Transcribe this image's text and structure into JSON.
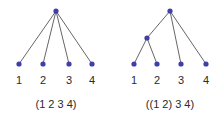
{
  "colors": {
    "node": "#3f3fa8",
    "edge": "#555555",
    "text": "#2a2a2a"
  },
  "trees": [
    {
      "caption": "(1 2 3 4)",
      "leaves": [
        "1",
        "2",
        "3",
        "4"
      ]
    },
    {
      "caption": "((1 2) 3 4)",
      "leaves": [
        "1",
        "2",
        "3",
        "4"
      ]
    }
  ]
}
